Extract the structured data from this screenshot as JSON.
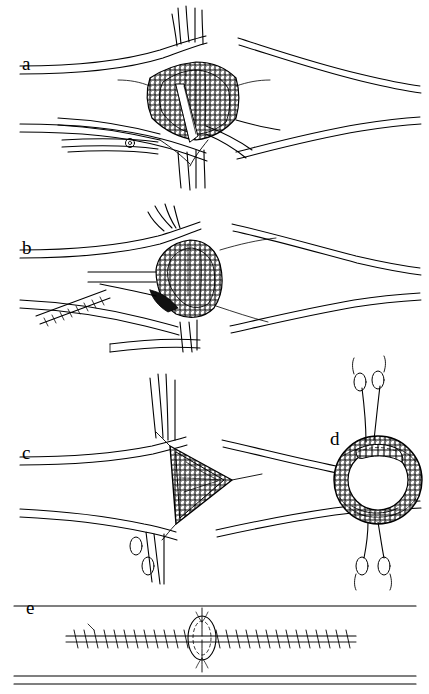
{
  "figure": {
    "background_color": "#ffffff",
    "ink_color": "#000000",
    "shading_color": "#d9d9d9",
    "width": 429,
    "height": 694
  },
  "panels": [
    {
      "id": "a",
      "label": "a",
      "description": "Longitudinal incision in vessel held open by stay sutures, retractors at top and bottom"
    },
    {
      "id": "b",
      "label": "b",
      "description": "Oval defect opened with clamp and hatched instrument approaching from the left"
    },
    {
      "id": "c",
      "label": "c",
      "description": "Triangular patch secured with sutures at vertices"
    },
    {
      "id": "d",
      "label": "d",
      "description": "Cross-sectional ring view of the anastomosis with sutures top and bottom"
    },
    {
      "id": "e",
      "label": "e",
      "description": "Completed running suture line along the vessel with oval closure marked"
    }
  ]
}
